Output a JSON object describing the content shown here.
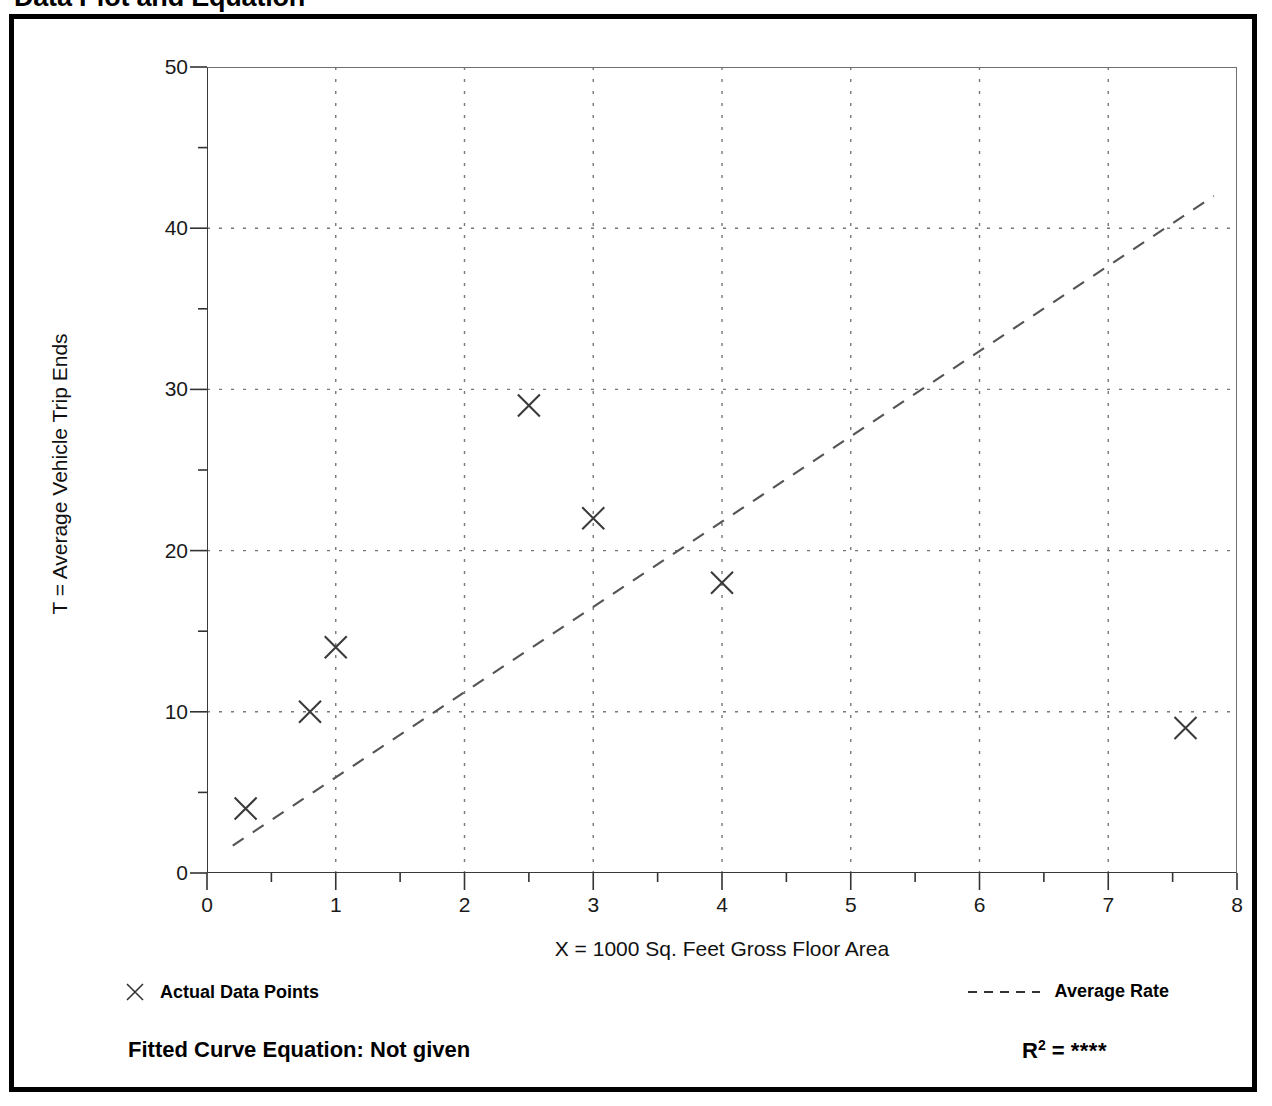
{
  "page": {
    "title": "Data Plot and Equation"
  },
  "legend": {
    "points_label": "Actual Data Points",
    "rate_label": "Average Rate",
    "points_marker": "x-marker-icon",
    "rate_marker": "dashed-line-icon"
  },
  "footer": {
    "fitted_equation_label": "Fitted Curve Equation:  Not given",
    "r_squared_symbol": "R",
    "r_squared_exponent": "2",
    "r_squared_equals": " = ",
    "r_squared_value": "****"
  },
  "chart_data": {
    "type": "scatter",
    "title": "Data Plot and Equation",
    "xlabel": "X = 1000 Sq. Feet Gross Floor Area",
    "ylabel": "T = Average Vehicle Trip Ends",
    "xlim": [
      0,
      8
    ],
    "ylim": [
      0,
      50
    ],
    "xticks": [
      0,
      1,
      2,
      3,
      4,
      5,
      6,
      7,
      8
    ],
    "xtick_labels": [
      "0",
      "1",
      "2",
      "3",
      "4",
      "5",
      "6",
      "7",
      "8"
    ],
    "xminor_step": 0.5,
    "yticks": [
      0,
      10,
      20,
      30,
      40,
      50
    ],
    "ytick_labels": [
      "0",
      "10",
      "20",
      "30",
      "40",
      "50"
    ],
    "yminor_step": 5,
    "grid": true,
    "grid_style": "dotted",
    "legend_position": "below-plot",
    "series": [
      {
        "name": "Actual Data Points",
        "type": "scatter",
        "marker": "x",
        "points": [
          {
            "x": 0.3,
            "y": 4
          },
          {
            "x": 0.8,
            "y": 10
          },
          {
            "x": 1.0,
            "y": 14
          },
          {
            "x": 2.5,
            "y": 29
          },
          {
            "x": 3.0,
            "y": 22
          },
          {
            "x": 4.0,
            "y": 18
          },
          {
            "x": 7.6,
            "y": 9
          }
        ]
      },
      {
        "name": "Average Rate",
        "type": "line",
        "style": "dashed",
        "endpoints": [
          {
            "x": 0.2,
            "y": 1.7
          },
          {
            "x": 7.82,
            "y": 42.0
          }
        ]
      }
    ]
  }
}
